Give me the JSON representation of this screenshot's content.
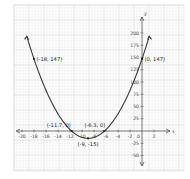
{
  "chart_data": {
    "type": "line",
    "title": "",
    "xlabel": "x",
    "ylabel": "y",
    "equation": "y = 2(x + 9)^2 - 15",
    "xlim": [
      -20.5,
      3.5
    ],
    "ylim": [
      -60,
      210
    ],
    "grid": true,
    "x_ticks": [
      -20,
      -18,
      -16,
      -14,
      -12,
      -10,
      -8,
      -6,
      -4,
      -2,
      0,
      2
    ],
    "x_tick_labels": [
      "-20",
      "-18",
      "-16",
      "-14",
      "-12",
      "-10",
      "-8",
      "-6",
      "-4",
      "-2",
      "0",
      "2"
    ],
    "y_ticks": [
      -50,
      -25,
      25,
      50,
      75,
      100,
      125,
      150,
      175,
      200
    ],
    "y_tick_labels": [
      "-50",
      "-25",
      "25",
      "50",
      "75",
      "100",
      "125",
      "150",
      "175",
      "200"
    ],
    "series": [
      {
        "name": "parabola",
        "x": [
          -20,
          -19,
          -18,
          -17,
          -16,
          -15,
          -14,
          -13,
          -12,
          -11.7,
          -11,
          -10,
          -9,
          -8,
          -7,
          -6.3,
          -6,
          -5,
          -4,
          -3,
          -2,
          -1,
          0,
          1,
          1.2
        ],
        "y": [
          227,
          185,
          147,
          113,
          83,
          57,
          35,
          17,
          3,
          0,
          -7,
          -13,
          -15,
          -13,
          -7,
          0,
          3,
          17,
          35,
          57,
          83,
          113,
          147,
          185,
          193
        ]
      }
    ],
    "annotations": [
      {
        "label": "(-18, 147)",
        "x": -18,
        "y": 147
      },
      {
        "label": "(0, 147)",
        "x": 0,
        "y": 147
      },
      {
        "label": "(-11.7, 0)",
        "x": -11.7,
        "y": 0
      },
      {
        "label": "(-6.3, 0)",
        "x": -6.3,
        "y": 0
      },
      {
        "label": "(-9, -15)",
        "x": -9,
        "y": -15
      }
    ]
  },
  "axes": {
    "x_name": "x",
    "y_name": "y",
    "origin_label": "0"
  }
}
